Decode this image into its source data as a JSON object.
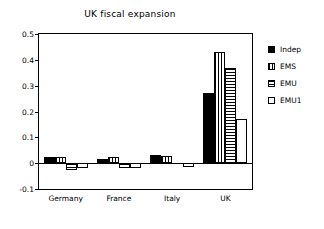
{
  "chart_data": {
    "type": "bar",
    "title": "UK fiscal expansion",
    "xlabel": "",
    "ylabel": "",
    "categories": [
      "Germany",
      "France",
      "Italy",
      "UK"
    ],
    "series": [
      {
        "name": "Indep",
        "pattern": "solid",
        "values": [
          0.025,
          0.018,
          0.032,
          0.27
        ]
      },
      {
        "name": "EMS",
        "pattern": "vertical-stripes",
        "values": [
          0.025,
          0.025,
          0.028,
          0.43
        ]
      },
      {
        "name": "EMU",
        "pattern": "horizontal-stripes",
        "values": [
          -0.025,
          -0.018,
          0.0,
          0.37
        ]
      },
      {
        "name": "EMU1",
        "pattern": "empty",
        "values": [
          -0.02,
          -0.02,
          -0.015,
          0.17
        ]
      }
    ],
    "ylim": [
      -0.1,
      0.5
    ],
    "yticks": [
      -0.1,
      0,
      0.1,
      0.2,
      0.3,
      0.4,
      0.5
    ],
    "ytick_labels": [
      "-0.1",
      "0",
      "0.1",
      "0.2",
      "0.3",
      "0.4",
      "0.5"
    ],
    "grid": false,
    "legend_position": "right-outside",
    "legend_entries": [
      "Indep",
      "EMS",
      "EMU",
      "EMU1"
    ],
    "colors": {
      "foreground": "#000000",
      "background": "#ffffff"
    }
  }
}
